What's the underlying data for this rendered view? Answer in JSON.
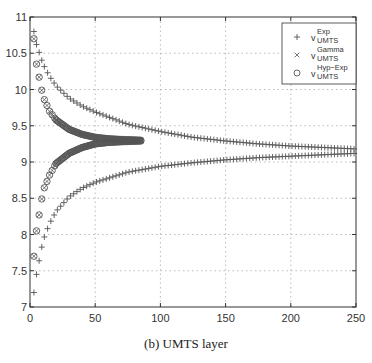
{
  "caption": "(b) UMTS layer",
  "chart_data": {
    "type": "scatter",
    "title": "",
    "xlabel": "",
    "ylabel": "",
    "xlim": [
      0,
      250
    ],
    "ylim": [
      7,
      11
    ],
    "x_ticks": [
      0,
      50,
      100,
      150,
      200,
      250
    ],
    "y_ticks": [
      7,
      7.5,
      8,
      8.5,
      9,
      9.5,
      10,
      10.5,
      11
    ],
    "x_tick_labels": [
      "0",
      "50",
      "100",
      "150",
      "200",
      "250"
    ],
    "y_tick_labels": [
      "7",
      "7.5",
      "8",
      "8.5",
      "9",
      "9.5",
      "10",
      "10.5",
      "11"
    ],
    "grid": true,
    "legend_position": "upper right",
    "legend": [
      {
        "marker": "+",
        "base": "v",
        "sup": "Exp",
        "sub": "UMTS"
      },
      {
        "marker": "×",
        "base": "v",
        "sup": "Gamma",
        "sub": "UMTS"
      },
      {
        "marker": "○",
        "base": "v",
        "sup": "Hyp−Exp",
        "sub": "UMTS"
      }
    ],
    "series": [
      {
        "name": "v_UMTS^Exp (upper bound)",
        "marker": "+",
        "x": [
          3,
          5,
          10,
          15,
          20,
          30,
          40,
          50,
          75,
          100,
          125,
          150,
          175,
          200,
          225,
          250
        ],
        "y": [
          10.8,
          10.62,
          10.35,
          10.18,
          10.05,
          9.88,
          9.77,
          9.69,
          9.52,
          9.42,
          9.34,
          9.29,
          9.25,
          9.22,
          9.2,
          9.18
        ]
      },
      {
        "name": "v_UMTS^Exp (lower bound)",
        "marker": "+",
        "x": [
          3,
          5,
          10,
          15,
          20,
          30,
          40,
          50,
          75,
          100,
          125,
          150,
          175,
          200,
          225,
          250
        ],
        "y": [
          7.2,
          7.45,
          7.92,
          8.15,
          8.32,
          8.52,
          8.64,
          8.72,
          8.86,
          8.94,
          8.99,
          9.03,
          9.06,
          9.08,
          9.1,
          9.12
        ]
      },
      {
        "name": "v_UMTS^Gamma (upper bound)",
        "marker": "×",
        "x": [
          3,
          5,
          10,
          15,
          20,
          30,
          40,
          50,
          60,
          70,
          85
        ],
        "y": [
          10.7,
          10.35,
          9.9,
          9.7,
          9.58,
          9.45,
          9.38,
          9.34,
          9.32,
          9.31,
          9.3
        ]
      },
      {
        "name": "v_UMTS^Gamma (lower bound)",
        "marker": "×",
        "x": [
          3,
          5,
          10,
          15,
          20,
          30,
          40,
          50,
          60,
          70,
          85
        ],
        "y": [
          7.7,
          8.05,
          8.6,
          8.82,
          8.98,
          9.12,
          9.2,
          9.25,
          9.27,
          9.28,
          9.29
        ]
      },
      {
        "name": "v_UMTS^Hyp-Exp (upper bound)",
        "marker": "○",
        "x": [
          3,
          5,
          10,
          15,
          20,
          30,
          40,
          50,
          60,
          70,
          85
        ],
        "y": [
          10.7,
          10.35,
          9.9,
          9.7,
          9.58,
          9.45,
          9.38,
          9.34,
          9.32,
          9.31,
          9.3
        ]
      },
      {
        "name": "v_UMTS^Hyp-Exp (lower bound)",
        "marker": "○",
        "x": [
          3,
          5,
          10,
          15,
          20,
          30,
          40,
          50,
          60,
          70,
          85
        ],
        "y": [
          7.7,
          8.05,
          8.6,
          8.82,
          8.98,
          9.12,
          9.2,
          9.25,
          9.27,
          9.28,
          9.29
        ]
      }
    ]
  },
  "colors": {
    "marker": "#555555",
    "axis": "#333333",
    "grid": "#aaaaaa"
  }
}
